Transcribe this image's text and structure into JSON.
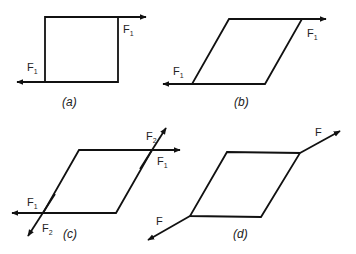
{
  "panels": [
    {
      "id": "a",
      "caption": "(a)",
      "labels": [
        {
          "base": "F",
          "sub": "1",
          "pos": "upper-right"
        },
        {
          "base": "F",
          "sub": "1",
          "pos": "lower-left"
        }
      ]
    },
    {
      "id": "b",
      "caption": "(b)",
      "labels": [
        {
          "base": "F",
          "sub": "1",
          "pos": "upper-right"
        },
        {
          "base": "F",
          "sub": "1",
          "pos": "lower-left"
        }
      ]
    },
    {
      "id": "c",
      "caption": "(c)",
      "labels": [
        {
          "base": "F",
          "sub": "2",
          "pos": "upper-right-diagonal"
        },
        {
          "base": "F",
          "sub": "1",
          "pos": "upper-right"
        },
        {
          "base": "F",
          "sub": "1",
          "pos": "lower-left"
        },
        {
          "base": "F",
          "sub": "2",
          "pos": "lower-left-diagonal"
        }
      ]
    },
    {
      "id": "d",
      "caption": "(d)",
      "labels": [
        {
          "base": "F",
          "sub": "",
          "pos": "upper-right-diagonal"
        },
        {
          "base": "F",
          "sub": "",
          "pos": "lower-left-diagonal"
        }
      ]
    }
  ],
  "colors": {
    "stroke": "#111111",
    "background": "#ffffff"
  }
}
